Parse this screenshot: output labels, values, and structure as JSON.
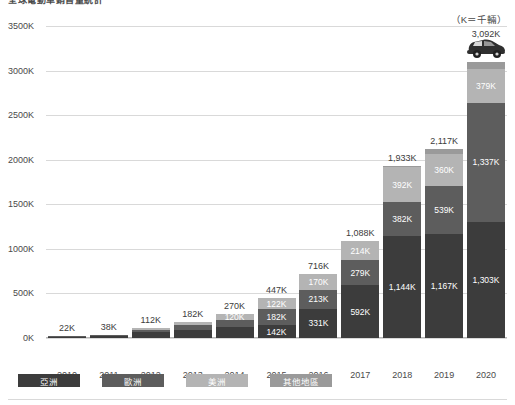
{
  "header": {
    "title": "全球電動車銷售量統計",
    "unit_note": "（K＝千輛）"
  },
  "chart_data": {
    "type": "bar",
    "stacked": true,
    "title": "全球電動車銷售量統計",
    "xlabel": "",
    "ylabel": "",
    "ylim": [
      0,
      3500
    ],
    "ytick_labels": [
      "3500K",
      "3000K",
      "2500K",
      "2000K",
      "1500K",
      "1000K",
      "500K",
      "0K"
    ],
    "ytick_values": [
      3500,
      3000,
      2500,
      2000,
      1500,
      1000,
      500,
      0
    ],
    "grid": true,
    "legend_position": "bottom",
    "categories": [
      "2010",
      "2011",
      "2012",
      "2013",
      "2014",
      "2015",
      "2016",
      "2017",
      "2018",
      "2019",
      "2020"
    ],
    "series": [
      {
        "name": "亞洲",
        "color": "#3c3c3c",
        "values": [
          12,
          20,
          62,
          95,
          120,
          142,
          331,
          592,
          1144,
          1167,
          1303
        ],
        "labels": [
          "",
          "",
          "",
          "",
          "",
          "142K",
          "331K",
          "592K",
          "1,144K",
          "1,167K",
          "1,303K"
        ]
      },
      {
        "name": "歐洲",
        "color": "#5d5d5d",
        "values": [
          6,
          10,
          30,
          50,
          80,
          182,
          213,
          279,
          382,
          539,
          1337
        ],
        "labels": [
          "",
          "",
          "",
          "",
          "",
          "182K",
          "213K",
          "279K",
          "382K",
          "539K",
          "1,337K"
        ]
      },
      {
        "name": "美洲",
        "color": "#b4b4b4",
        "values": [
          4,
          8,
          20,
          37,
          70,
          122,
          170,
          214,
          392,
          360,
          379
        ],
        "labels": [
          "",
          "",
          "",
          "",
          "120K",
          "122K",
          "170K",
          "214K",
          "392K",
          "360K",
          "379K"
        ]
      },
      {
        "name": "其他地區",
        "color": "#9a9a9a",
        "values": [
          0,
          0,
          0,
          0,
          0,
          1,
          2,
          3,
          15,
          51,
          73
        ],
        "labels": [
          "",
          "",
          "",
          "",
          "",
          "",
          "",
          "",
          "",
          "",
          ""
        ]
      }
    ],
    "totals": [
      22,
      38,
      112,
      182,
      270,
      447,
      716,
      1088,
      1933,
      2117,
      3092
    ],
    "total_labels": [
      "22K",
      "38K",
      "112K",
      "182K",
      "270K",
      "447K",
      "716K",
      "1,088K",
      "1,933K",
      "2,117K",
      "3,092K"
    ],
    "annotations": [
      {
        "name": "car-icon",
        "category": "2020",
        "type": "icon"
      }
    ]
  },
  "legend": {
    "items": [
      {
        "label": "亞洲",
        "color": "#3c3c3c"
      },
      {
        "label": "歐洲",
        "color": "#5d5d5d"
      },
      {
        "label": "美洲",
        "color": "#b4b4b4"
      },
      {
        "label": "其他地區",
        "color": "#9a9a9a"
      }
    ]
  }
}
